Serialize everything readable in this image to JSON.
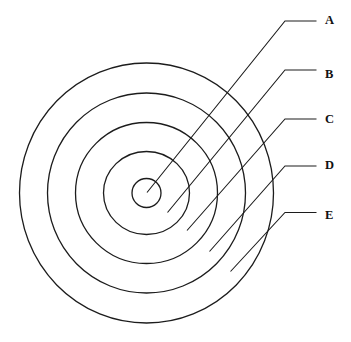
{
  "diagram": {
    "type": "concentric-circles-with-labels",
    "center": [
      146.5,
      193
    ],
    "rings": [
      {
        "name": "ring-1",
        "rx": 14.5,
        "ry": 14.5
      },
      {
        "name": "ring-2",
        "rx": 43,
        "ry": 41.5
      },
      {
        "name": "ring-3",
        "rx": 71,
        "ry": 70.5
      },
      {
        "name": "ring-4",
        "rx": 99,
        "ry": 100
      },
      {
        "name": "ring-5",
        "rx": 127,
        "ry": 130
      }
    ],
    "labels": [
      {
        "text": "A",
        "elbow": [
          285,
          21
        ],
        "end": [
          316.5,
          21
        ],
        "tip": [
          147,
          192.5
        ],
        "label_xy": [
          325,
          21.5
        ]
      },
      {
        "text": "B",
        "elbow": [
          285,
          70
        ],
        "end": [
          316.5,
          70
        ],
        "tip": [
          167.5,
          212.5
        ],
        "label_xy": [
          325,
          75
        ]
      },
      {
        "text": "C",
        "elbow": [
          285,
          119
        ],
        "end": [
          316.5,
          119
        ],
        "tip": [
          187,
          230.5
        ],
        "label_xy": [
          325,
          120
        ]
      },
      {
        "text": "D",
        "elbow": [
          285,
          166
        ],
        "end": [
          316.5,
          166
        ],
        "tip": [
          209.5,
          251.5
        ],
        "label_xy": [
          325,
          166.5
        ]
      },
      {
        "text": "E",
        "elbow": [
          285,
          212.5
        ],
        "end": [
          316.5,
          212.5
        ],
        "tip": [
          230.5,
          271.5
        ],
        "label_xy": [
          325,
          216
        ]
      }
    ],
    "colors": {
      "stroke": "#1c1c1c",
      "background": "#ffffff",
      "text": "#111111"
    }
  }
}
